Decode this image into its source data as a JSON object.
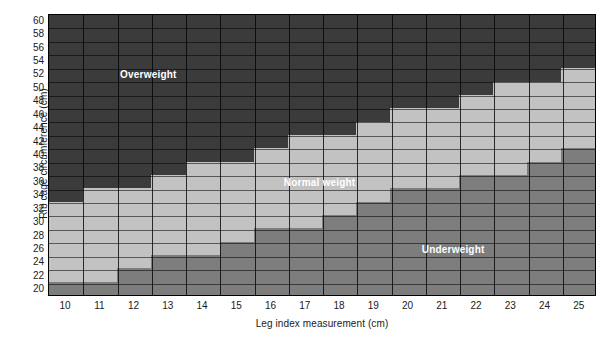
{
  "chart_data": {
    "type": "heatmap",
    "title": "",
    "xlabel": "Leg index measurement (cm)",
    "ylabel": "Rib cage circumference (cm)",
    "grid": true,
    "legend_position": "in-plot-annotations",
    "x": [
      10,
      11,
      12,
      13,
      14,
      15,
      16,
      17,
      18,
      19,
      20,
      21,
      22,
      23,
      24,
      25
    ],
    "y": [
      20,
      22,
      24,
      26,
      28,
      30,
      32,
      34,
      36,
      38,
      40,
      42,
      44,
      46,
      48,
      50,
      52,
      54,
      56,
      58,
      60
    ],
    "xlim": [
      9.5,
      25.5
    ],
    "ylim": [
      19,
      61
    ],
    "xtick_labels": [
      "10",
      "11",
      "12",
      "13",
      "14",
      "15",
      "16",
      "17",
      "18",
      "19",
      "20",
      "21",
      "22",
      "23",
      "24",
      "25"
    ],
    "ytick_labels": [
      "20",
      "22",
      "24",
      "26",
      "28",
      "30",
      "32",
      "34",
      "36",
      "38",
      "40",
      "42",
      "44",
      "46",
      "48",
      "50",
      "52",
      "54",
      "56",
      "58",
      "60"
    ],
    "categories_legend": [
      "Overweight",
      "Normal weight",
      "Underweight"
    ],
    "category_colors": {
      "overweight": "#3b3b3b",
      "normal": "#c2c2c2",
      "underweight": "#7d7d7d"
    },
    "annotations": [
      {
        "text": "Overweight",
        "x": 12.4,
        "y": 52
      },
      {
        "text": "Normal weight",
        "x": 17.4,
        "y": 36
      },
      {
        "text": "Underweight",
        "x": 21.3,
        "y": 26
      }
    ],
    "normal_band": [
      {
        "x": 10,
        "y_min": 20,
        "y_max": 32
      },
      {
        "x": 11,
        "y_min": 22,
        "y_max": 34
      },
      {
        "x": 12,
        "y_min": 24,
        "y_max": 34
      },
      {
        "x": 13,
        "y_min": 26,
        "y_max": 36
      },
      {
        "x": 14,
        "y_min": 26,
        "y_max": 38
      },
      {
        "x": 15,
        "y_min": 28,
        "y_max": 38
      },
      {
        "x": 16,
        "y_min": 30,
        "y_max": 40
      },
      {
        "x": 17,
        "y_min": 32,
        "y_max": 42
      },
      {
        "x": 18,
        "y_min": 32,
        "y_max": 42
      },
      {
        "x": 19,
        "y_min": 34,
        "y_max": 44
      },
      {
        "x": 20,
        "y_min": 36,
        "y_max": 46
      },
      {
        "x": 21,
        "y_min": 36,
        "y_max": 46
      },
      {
        "x": 22,
        "y_min": 38,
        "y_max": 48
      },
      {
        "x": 23,
        "y_min": 40,
        "y_max": 50
      },
      {
        "x": 24,
        "y_min": 40,
        "y_max": 50
      },
      {
        "x": 25,
        "y_min": 42,
        "y_max": 52
      }
    ],
    "cells": [
      {
        "y": 60,
        "row": [
          "over",
          "over",
          "over",
          "over",
          "over",
          "over",
          "over",
          "over",
          "over",
          "over",
          "over",
          "over",
          "over",
          "over",
          "over",
          "over"
        ]
      },
      {
        "y": 58,
        "row": [
          "over",
          "over",
          "over",
          "over",
          "over",
          "over",
          "over",
          "over",
          "over",
          "over",
          "over",
          "over",
          "over",
          "over",
          "over",
          "over"
        ]
      },
      {
        "y": 56,
        "row": [
          "over",
          "over",
          "over",
          "over",
          "over",
          "over",
          "over",
          "over",
          "over",
          "over",
          "over",
          "over",
          "over",
          "over",
          "over",
          "over"
        ]
      },
      {
        "y": 54,
        "row": [
          "over",
          "over",
          "over",
          "over",
          "over",
          "over",
          "over",
          "over",
          "over",
          "over",
          "over",
          "over",
          "over",
          "over",
          "over",
          "over"
        ]
      },
      {
        "y": 52,
        "row": [
          "over",
          "over",
          "over",
          "over",
          "over",
          "over",
          "over",
          "over",
          "over",
          "over",
          "over",
          "over",
          "over",
          "over",
          "over",
          "norm"
        ]
      },
      {
        "y": 50,
        "row": [
          "over",
          "over",
          "over",
          "over",
          "over",
          "over",
          "over",
          "over",
          "over",
          "over",
          "over",
          "over",
          "over",
          "norm",
          "norm",
          "norm"
        ]
      },
      {
        "y": 48,
        "row": [
          "over",
          "over",
          "over",
          "over",
          "over",
          "over",
          "over",
          "over",
          "over",
          "over",
          "over",
          "over",
          "norm",
          "norm",
          "norm",
          "norm"
        ]
      },
      {
        "y": 46,
        "row": [
          "over",
          "over",
          "over",
          "over",
          "over",
          "over",
          "over",
          "over",
          "over",
          "over",
          "norm",
          "norm",
          "norm",
          "norm",
          "norm",
          "norm"
        ]
      },
      {
        "y": 44,
        "row": [
          "over",
          "over",
          "over",
          "over",
          "over",
          "over",
          "over",
          "over",
          "over",
          "norm",
          "norm",
          "norm",
          "norm",
          "norm",
          "norm",
          "norm"
        ]
      },
      {
        "y": 42,
        "row": [
          "over",
          "over",
          "over",
          "over",
          "over",
          "over",
          "over",
          "norm",
          "norm",
          "norm",
          "norm",
          "norm",
          "norm",
          "norm",
          "norm",
          "norm"
        ]
      },
      {
        "y": 40,
        "row": [
          "over",
          "over",
          "over",
          "over",
          "over",
          "over",
          "norm",
          "norm",
          "norm",
          "norm",
          "norm",
          "norm",
          "norm",
          "norm",
          "norm",
          "under"
        ]
      },
      {
        "y": 38,
        "row": [
          "over",
          "over",
          "over",
          "over",
          "norm",
          "norm",
          "norm",
          "norm",
          "norm",
          "norm",
          "norm",
          "norm",
          "norm",
          "norm",
          "under",
          "under"
        ]
      },
      {
        "y": 36,
        "row": [
          "over",
          "over",
          "over",
          "norm",
          "norm",
          "norm",
          "norm",
          "norm",
          "norm",
          "norm",
          "norm",
          "norm",
          "under",
          "under",
          "under",
          "under"
        ]
      },
      {
        "y": 34,
        "row": [
          "over",
          "norm",
          "norm",
          "norm",
          "norm",
          "norm",
          "norm",
          "norm",
          "norm",
          "norm",
          "under",
          "under",
          "under",
          "under",
          "under",
          "under"
        ]
      },
      {
        "y": 32,
        "row": [
          "norm",
          "norm",
          "norm",
          "norm",
          "norm",
          "norm",
          "norm",
          "norm",
          "norm",
          "under",
          "under",
          "under",
          "under",
          "under",
          "under",
          "under"
        ]
      },
      {
        "y": 30,
        "row": [
          "norm",
          "norm",
          "norm",
          "norm",
          "norm",
          "norm",
          "norm",
          "norm",
          "under",
          "under",
          "under",
          "under",
          "under",
          "under",
          "under",
          "under"
        ]
      },
      {
        "y": 28,
        "row": [
          "norm",
          "norm",
          "norm",
          "norm",
          "norm",
          "norm",
          "under",
          "under",
          "under",
          "under",
          "under",
          "under",
          "under",
          "under",
          "under",
          "under"
        ]
      },
      {
        "y": 26,
        "row": [
          "norm",
          "norm",
          "norm",
          "norm",
          "norm",
          "under",
          "under",
          "under",
          "under",
          "under",
          "under",
          "under",
          "under",
          "under",
          "under",
          "under"
        ]
      },
      {
        "y": 24,
        "row": [
          "norm",
          "norm",
          "norm",
          "under",
          "under",
          "under",
          "under",
          "under",
          "under",
          "under",
          "under",
          "under",
          "under",
          "under",
          "under",
          "under"
        ]
      },
      {
        "y": 22,
        "row": [
          "norm",
          "norm",
          "under",
          "under",
          "under",
          "under",
          "under",
          "under",
          "under",
          "under",
          "under",
          "under",
          "under",
          "under",
          "under",
          "under"
        ]
      },
      {
        "y": 20,
        "row": [
          "under",
          "under",
          "under",
          "under",
          "under",
          "under",
          "under",
          "under",
          "under",
          "under",
          "under",
          "under",
          "under",
          "under",
          "under",
          "under"
        ]
      }
    ]
  },
  "axes": {
    "y_title": "Rib cage circumference (cm)",
    "x_title": "Leg index measurement (cm)"
  },
  "zones": {
    "overweight": "Overweight",
    "normal": "Normal weight",
    "underweight": "Underweight"
  }
}
